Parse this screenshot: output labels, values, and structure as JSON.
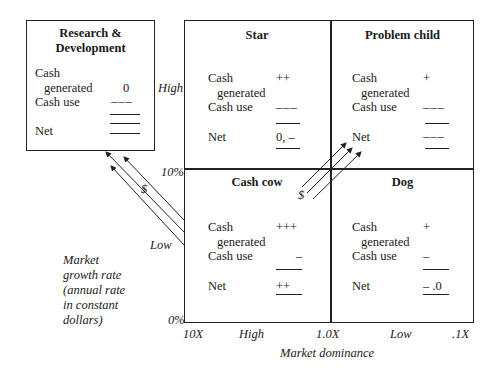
{
  "rd_box": {
    "title_line1": "Research &",
    "title_line2": "Development",
    "cash": "Cash",
    "generated": "generated",
    "generated_value": "0",
    "cash_use": "Cash use",
    "cash_use_value": "___",
    "net": "Net"
  },
  "quadrants": {
    "star": {
      "title": "Star",
      "cash": "Cash",
      "generated": "generated",
      "generated_value": "++",
      "cash_use": "Cash use",
      "cash_use_value": "___",
      "net": "Net",
      "net_value": "0, –"
    },
    "problem_child": {
      "title": "Problem child",
      "cash": "Cash",
      "generated": "generated",
      "generated_value": "+",
      "cash_use": "Cash use",
      "cash_use_value": "___",
      "net": "Net",
      "net_value": "___"
    },
    "cash_cow": {
      "title": "Cash cow",
      "cash": "Cash",
      "generated": "generated",
      "generated_value": "+++",
      "cash_use": "Cash use",
      "cash_use_value": "–",
      "net": "Net",
      "net_value": "++"
    },
    "dog": {
      "title": "Dog",
      "cash": "Cash",
      "generated": "generated",
      "generated_value": "+",
      "cash_use": "Cash use",
      "cash_use_value": "–",
      "net": "Net",
      "net_value": "– .0"
    }
  },
  "y_axis": {
    "high": "High",
    "mid": "10%",
    "low": "Low",
    "zero": "0%",
    "label_lines": [
      "Market",
      "growth rate",
      "(annual rate",
      "in constant",
      "dollars)"
    ]
  },
  "x_axis": {
    "ticks": [
      "10X",
      "High",
      "1.0X",
      "Low",
      ".1X"
    ],
    "label": "Market dominance"
  },
  "arrows": {
    "cow_to_rd_label": "$",
    "cow_to_problem_label": "$"
  }
}
